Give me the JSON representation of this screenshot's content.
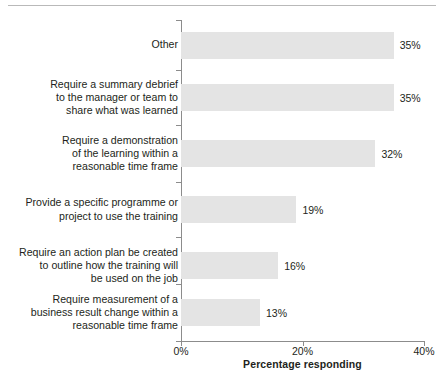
{
  "chart_data": {
    "type": "bar",
    "orientation": "horizontal",
    "title": "",
    "xlabel": "Percentage responding",
    "ylabel": "",
    "xlim": [
      0,
      40
    ],
    "xticks": [
      "0%",
      "20%",
      "40%"
    ],
    "xtick_values": [
      0,
      20,
      40
    ],
    "grid": false,
    "legend": null,
    "categories": [
      "Other",
      "Require a summary debrief\nto the manager or team to\nshare what was learned",
      "Require a demonstration\nof the learning within a\nreasonable time frame",
      "Provide a specific programme or\nproject to use the training",
      "Require an action plan be created\nto outline how the training will\nbe used on the job",
      "Require measurement of a\nbusiness result change within a\nreasonable time frame"
    ],
    "values": [
      35,
      35,
      32,
      19,
      16,
      13
    ],
    "data_labels": [
      "35%",
      "35%",
      "32%",
      "19%",
      "16%",
      "13%"
    ],
    "bar_color": "#e4e4e4",
    "axis_color": "#8c8c8c",
    "text_color": "#231f20"
  }
}
